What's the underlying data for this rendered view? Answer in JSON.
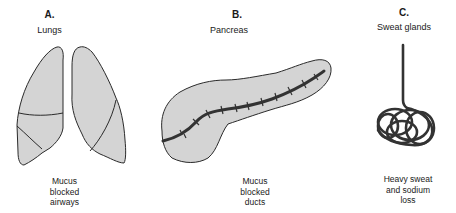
{
  "panels": [
    {
      "letter": "A.",
      "title": "Lungs",
      "caption": [
        "Mucus",
        "blocked",
        "airways"
      ],
      "icon": "lungs-illustration"
    },
    {
      "letter": "B.",
      "title": "Pancreas",
      "caption": [
        "Mucus",
        "blocked",
        "ducts"
      ],
      "icon": "pancreas-illustration"
    },
    {
      "letter": "C.",
      "title": "Sweat glands",
      "caption": [
        "Heavy sweat",
        "and sodium",
        "loss"
      ],
      "icon": "sweat-gland-illustration"
    }
  ],
  "colors": {
    "organ_fill": "#d4d4d4",
    "outline": "#2a2a2a",
    "duct": "#333333",
    "background": "#ffffff"
  }
}
